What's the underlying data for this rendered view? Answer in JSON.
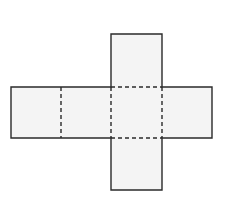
{
  "diagram": {
    "type": "cube-net",
    "colors": {
      "face_fill": "#f4f4f4",
      "line": "#2a2a2a",
      "background": "#ffffff"
    },
    "square_size": 51,
    "faces": [
      {
        "id": "left-1",
        "x": 11,
        "y": 87
      },
      {
        "id": "left-2",
        "x": 61,
        "y": 87
      },
      {
        "id": "center",
        "x": 111,
        "y": 87
      },
      {
        "id": "right",
        "x": 162,
        "y": 87
      },
      {
        "id": "top",
        "x": 111,
        "y": 34
      },
      {
        "id": "bottom",
        "x": 111,
        "y": 138
      }
    ],
    "fold_lines": [
      {
        "from": [
          61,
          87
        ],
        "to": [
          61,
          138
        ]
      },
      {
        "from": [
          111,
          87
        ],
        "to": [
          111,
          138
        ]
      },
      {
        "from": [
          162,
          87
        ],
        "to": [
          162,
          138
        ]
      },
      {
        "from": [
          111,
          87
        ],
        "to": [
          162,
          87
        ]
      },
      {
        "from": [
          111,
          138
        ],
        "to": [
          162,
          138
        ]
      }
    ]
  }
}
